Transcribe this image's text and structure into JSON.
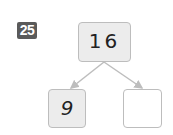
{
  "problem": {
    "number": "25",
    "badge_color": "#5a5a5a"
  },
  "number_bond": {
    "whole": "16",
    "parts": [
      {
        "value": "9",
        "filled": true
      },
      {
        "value": "",
        "filled": false
      }
    ],
    "box_fill": "#ececec",
    "border_color": "#bdbdbd",
    "arrow_color": "#bdbdbd"
  }
}
